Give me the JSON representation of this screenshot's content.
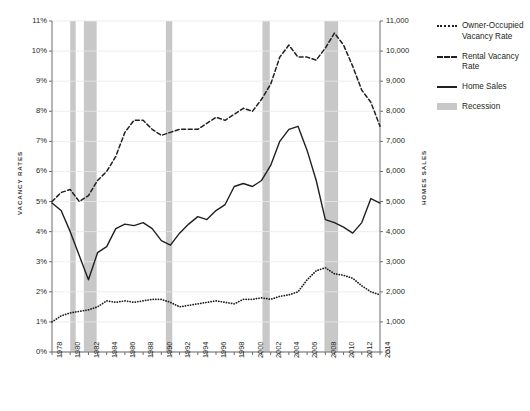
{
  "chart_data": {
    "type": "line",
    "title": "",
    "subtitle": "",
    "xlabel": "",
    "ylabel": "VACANCY RATES",
    "ylabel_right": "HOMES SALES",
    "grid": true,
    "legend_position": "right",
    "xlim": [
      1978,
      2014
    ],
    "ylim": [
      0,
      11
    ],
    "ylim_right": [
      0,
      11000
    ],
    "x": [
      1978,
      1979,
      1980,
      1981,
      1982,
      1983,
      1984,
      1985,
      1986,
      1987,
      1988,
      1989,
      1990,
      1991,
      1992,
      1993,
      1994,
      1995,
      1996,
      1997,
      1998,
      1999,
      2000,
      2001,
      2002,
      2003,
      2004,
      2005,
      2006,
      2007,
      2008,
      2009,
      2010,
      2011,
      2012,
      2013,
      2014
    ],
    "x_tick_labels": [
      "1978",
      "1980",
      "1982",
      "1984",
      "1986",
      "1988",
      "1990",
      "1992",
      "1994",
      "1996",
      "1998",
      "2000",
      "2002",
      "2004",
      "2006",
      "2008",
      "2010",
      "2012",
      "2014"
    ],
    "y_tick_labels": [
      "0%",
      "1%",
      "2%",
      "3%",
      "4%",
      "5%",
      "6%",
      "7%",
      "8%",
      "9%",
      "10%",
      "11%"
    ],
    "y_tick_labels_right": [
      "0",
      "1,000",
      "2,000",
      "3,000",
      "4,000",
      "5,000",
      "6,000",
      "7,000",
      "8,000",
      "9,000",
      "10,000",
      "11,000"
    ],
    "series": [
      {
        "name": "Owner-Occupied Vacancy Rate",
        "style": "dotted",
        "axis": "left",
        "units": "percent",
        "values": [
          1.0,
          1.2,
          1.3,
          1.35,
          1.4,
          1.5,
          1.7,
          1.65,
          1.7,
          1.65,
          1.7,
          1.75,
          1.75,
          1.65,
          1.5,
          1.55,
          1.6,
          1.65,
          1.7,
          1.65,
          1.6,
          1.75,
          1.75,
          1.8,
          1.75,
          1.85,
          1.9,
          2.0,
          2.4,
          2.7,
          2.8,
          2.6,
          2.55,
          2.45,
          2.2,
          2.0,
          1.9
        ]
      },
      {
        "name": "Rental Vacancy Rate",
        "style": "dashed",
        "axis": "left",
        "units": "percent",
        "values": [
          5.0,
          5.3,
          5.4,
          5.0,
          5.2,
          5.7,
          6.0,
          6.5,
          7.3,
          7.7,
          7.7,
          7.4,
          7.2,
          7.3,
          7.4,
          7.4,
          7.4,
          7.6,
          7.8,
          7.7,
          7.9,
          8.1,
          8.0,
          8.4,
          8.9,
          9.8,
          10.2,
          9.8,
          9.8,
          9.7,
          10.1,
          10.6,
          10.2,
          9.5,
          8.7,
          8.3,
          7.5
        ]
      },
      {
        "name": "Home Sales",
        "style": "solid",
        "axis": "right",
        "units": "thousands",
        "values": [
          4950,
          4700,
          4000,
          3200,
          2400,
          3300,
          3500,
          4100,
          4250,
          4200,
          4300,
          4100,
          3700,
          3550,
          3950,
          4250,
          4500,
          4400,
          4700,
          4900,
          5500,
          5600,
          5500,
          5700,
          6200,
          7000,
          7400,
          7500,
          6700,
          5700,
          4400,
          4300,
          4150,
          3950,
          4300,
          5100,
          4950
        ]
      }
    ],
    "recessions": [
      {
        "label": "Recession",
        "start": 1980.0,
        "end": 1980.6
      },
      {
        "label": "Recession",
        "start": 1981.5,
        "end": 1982.9
      },
      {
        "label": "Recession",
        "start": 1990.5,
        "end": 1991.2
      },
      {
        "label": "Recession",
        "start": 2001.1,
        "end": 2001.9
      },
      {
        "label": "Recession",
        "start": 2007.9,
        "end": 2009.4
      }
    ],
    "colors": {
      "line": "#231f20",
      "recession_band": "#c8c8c8",
      "grid": "#e8e8e8",
      "axis": "#6d6d6d",
      "background": "#ffffff"
    }
  },
  "legend": {
    "items": [
      {
        "label": "Owner-Occupied Vacancy Rate",
        "style": "dotted"
      },
      {
        "label": "Rental Vacancy Rate",
        "style": "dashed"
      },
      {
        "label": "Home Sales",
        "style": "solid"
      },
      {
        "label": "Recession",
        "style": "band"
      }
    ]
  }
}
